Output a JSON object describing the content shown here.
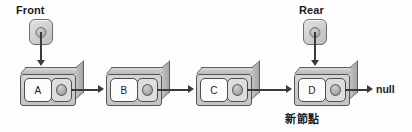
{
  "diagram": {
    "background_color": "#fdfdfd",
    "line_color": "#3a3a3a",
    "node_fill": "#d5d5d5",
    "data_cell_fill": "#fcfcfc",
    "pointer_cell_fill": "#dddddd"
  },
  "pointers": [
    {
      "name": "front-pointer",
      "label": "Front",
      "label_x": 16,
      "label_y": 4,
      "box_x": 29,
      "box_y": 19,
      "stem_x": 40,
      "stem_y": 32,
      "stem_height": 30,
      "arrow_x": 37,
      "arrow_y": 60
    },
    {
      "name": "rear-pointer",
      "label": "Rear",
      "label_x": 299,
      "label_y": 4,
      "box_x": 303,
      "box_y": 19,
      "stem_x": 314,
      "stem_y": 32,
      "stem_height": 30,
      "arrow_x": 311,
      "arrow_y": 60
    }
  ],
  "nodes": [
    {
      "name": "node-a",
      "data": "A",
      "x": 20,
      "y": 67,
      "pointer_icon": "pointer-dot"
    },
    {
      "name": "node-b",
      "data": "B",
      "x": 106,
      "y": 67,
      "pointer_icon": "pointer-dot"
    },
    {
      "name": "node-c",
      "data": "C",
      "x": 196,
      "y": 67,
      "pointer_icon": "pointer-dot"
    },
    {
      "name": "node-d",
      "data": "D",
      "x": 294,
      "y": 67,
      "pointer_icon": "pointer-dot"
    }
  ],
  "links": [
    {
      "name": "link-a-to-b",
      "x": 71,
      "y": 89,
      "width": 29,
      "arrow_x": 98,
      "arrow_y": 85
    },
    {
      "name": "link-b-to-c",
      "x": 157,
      "y": 89,
      "width": 33,
      "arrow_x": 188,
      "arrow_y": 85
    },
    {
      "name": "link-c-to-d",
      "x": 247,
      "y": 89,
      "width": 41,
      "arrow_x": 286,
      "arrow_y": 85
    },
    {
      "name": "link-d-to-null",
      "x": 345,
      "y": 89,
      "width": 24,
      "arrow_x": 367,
      "arrow_y": 85
    }
  ],
  "null_terminator": {
    "label": "null",
    "x": 376,
    "y": 83
  },
  "caption": {
    "text": "新節點",
    "x": 285,
    "y": 110
  }
}
